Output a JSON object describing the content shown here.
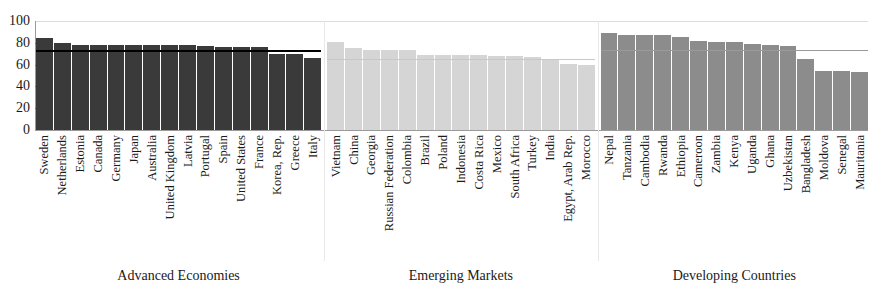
{
  "chart_data": {
    "type": "bar",
    "title": "",
    "subtitle": "",
    "xlabel": "",
    "ylabel": "",
    "ylim": [
      0,
      100
    ],
    "yticks": [
      0,
      20,
      40,
      60,
      80,
      100
    ],
    "grid": false,
    "legend": false,
    "orientation": "vertical",
    "groups": [
      {
        "name": "Advanced Economies",
        "color": "#3a3a3a",
        "average_line": 73,
        "average_line_color": "#000000",
        "categories": [
          "Sweden",
          "Netherlands",
          "Estonia",
          "Canada",
          "Germany",
          "Japan",
          "Australia",
          "United Kingdom",
          "Latvia",
          "Portugal",
          "Spain",
          "United States",
          "France",
          "Korea, Rep.",
          "Greece",
          "Italy"
        ],
        "values": [
          84,
          80,
          78,
          78,
          78,
          78,
          78,
          78,
          78,
          77,
          76,
          76,
          76,
          70,
          70,
          66
        ]
      },
      {
        "name": "Emerging Markets",
        "color": "#d5d5d5",
        "average_line": 65,
        "average_line_color": "#c8c8c8",
        "categories": [
          "Vietnam",
          "China",
          "Georgia",
          "Russian Federation",
          "Colombia",
          "Brazil",
          "Poland",
          "Indonesia",
          "Costa Rica",
          "Mexico",
          "South Africa",
          "Turkey",
          "India",
          "Egypt, Arab Rep.",
          "Morocco"
        ],
        "values": [
          81,
          75,
          73,
          73,
          73,
          69,
          69,
          69,
          69,
          68,
          68,
          67,
          64,
          61,
          60
        ]
      },
      {
        "name": "Developing Countries",
        "color": "#8c8c8c",
        "average_line": 73,
        "average_line_color": "#9a9a9a",
        "categories": [
          "Nepal",
          "Tanzania",
          "Cambodia",
          "Rwanda",
          "Ethiopia",
          "Cameroon",
          "Zambia",
          "Kenya",
          "Uganda",
          "Ghana",
          "Uzbekistan",
          "Bangladesh",
          "Moldova",
          "Senegal",
          "Mauritania"
        ],
        "values": [
          89,
          87,
          87,
          87,
          85,
          82,
          81,
          81,
          79,
          78,
          77,
          65,
          54,
          54,
          53
        ]
      }
    ]
  },
  "axis": {
    "y_tick_labels": [
      "0",
      "20",
      "40",
      "60",
      "80",
      "100"
    ]
  },
  "group_titles": {
    "advanced": "Advanced Economies",
    "emerging": "Emerging Markets",
    "developing": "Developing Countries"
  },
  "colors": {
    "advanced": "#3a3a3a",
    "emerging": "#d5d5d5",
    "developing": "#8c8c8c",
    "axis": "#9a9a9a",
    "text": "#1a1a1a"
  }
}
